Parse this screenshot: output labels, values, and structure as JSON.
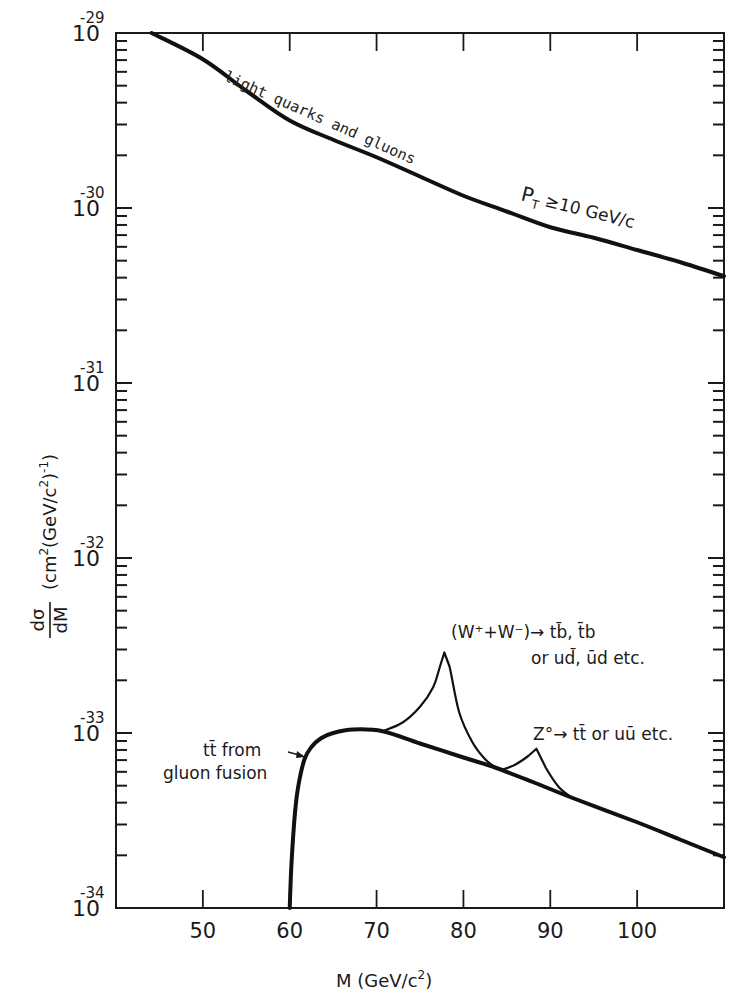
{
  "chart_data": {
    "type": "line",
    "title": "",
    "xlabel": "M (GeV/c²)",
    "ylabel": "dσ/dM (cm² (GeV/c²)⁻¹)",
    "xlim": [
      40,
      110
    ],
    "ylim": [
      1e-34,
      1e-29
    ],
    "yscale": "log",
    "grid": false,
    "legend": null,
    "x_ticks": [
      50,
      60,
      70,
      80,
      90,
      100
    ],
    "y_ticks": [
      {
        "base": "10",
        "exp": "-29",
        "value": 1e-29
      },
      {
        "base": "10",
        "exp": "-30",
        "value": 1e-30
      },
      {
        "base": "10",
        "exp": "-31",
        "value": 1e-31
      },
      {
        "base": "10",
        "exp": "-32",
        "value": 1e-32
      },
      {
        "base": "10",
        "exp": "-33",
        "value": 1e-33
      },
      {
        "base": "10",
        "exp": "-34",
        "value": 1e-34
      }
    ],
    "series": [
      {
        "name": "light quarks and gluons (P_T ≥ 10 GeV/c)",
        "style": "thick",
        "x": [
          44.1,
          50,
          55,
          60,
          65,
          70,
          75,
          80,
          85,
          90,
          95,
          100,
          105,
          110
        ],
        "log10_y": [
          -29.0,
          -29.15,
          -29.33,
          -29.5,
          -29.61,
          -29.71,
          -29.82,
          -29.93,
          -30.02,
          -30.11,
          -30.17,
          -30.24,
          -30.31,
          -30.39
        ]
      },
      {
        "name": "tt̄ from gluon fusion",
        "style": "thick",
        "x": [
          60.0,
          60.2,
          60.6,
          61.0,
          61.7,
          62.5,
          63.6,
          65.0,
          67.3,
          70.7,
          75,
          80,
          83.8,
          88,
          92.5,
          100,
          105,
          110
        ],
        "log10_y": [
          -34.0,
          -33.75,
          -33.46,
          -33.3,
          -33.15,
          -33.08,
          -33.03,
          -33.0,
          -32.98,
          -32.99,
          -33.06,
          -33.14,
          -33.2,
          -33.28,
          -33.37,
          -33.51,
          -33.61,
          -33.71
        ]
      },
      {
        "name": "(W⁺+W⁻) → tb̄, t̄b or ud̄, ūd etc.",
        "style": "thin",
        "x": [
          70.7,
          73,
          75,
          76.5,
          77.3,
          77.8,
          78.4,
          79.5,
          81,
          82.5,
          83.8
        ],
        "log10_y": [
          -32.99,
          -32.94,
          -32.85,
          -32.74,
          -32.62,
          -32.54,
          -32.62,
          -32.88,
          -33.05,
          -33.15,
          -33.2
        ]
      },
      {
        "name": "Z⁰ → tt̄ or uū etc.",
        "style": "thin",
        "x": [
          84.5,
          86,
          87.5,
          88.4,
          89.5,
          91,
          92.5
        ],
        "log10_y": [
          -33.21,
          -33.18,
          -33.13,
          -33.09,
          -33.2,
          -33.31,
          -33.37
        ]
      }
    ],
    "annotations": [
      {
        "id": "lq",
        "text": "light quarks and gluons"
      },
      {
        "id": "pt",
        "text_main": "P",
        "text_sub": "T",
        "text_rest": " ≥10 GeV/c"
      },
      {
        "id": "w_line1",
        "text": "(W⁺+W⁻)→ tb̄, t̄b"
      },
      {
        "id": "w_line2",
        "text": "or ud̄, ūd  etc."
      },
      {
        "id": "z",
        "text": "Z°→ tt̄ or uū  etc."
      },
      {
        "id": "tt_line1",
        "text": "tt̄ from"
      },
      {
        "id": "tt_line2",
        "text": "gluon fusion"
      }
    ]
  },
  "labels": {
    "xaxis_main": "M  (GeV/c",
    "xaxis_sup": "2",
    "xaxis_close": ")",
    "yaxis_num": "dσ",
    "yaxis_den": "dM",
    "yaxis_units_a": "(cm",
    "yaxis_units_sup1": "2",
    "yaxis_units_b": "(GeV/c",
    "yaxis_units_sup2": "2",
    "yaxis_units_c": ")",
    "yaxis_units_sup3": "-1",
    "yaxis_units_d": ")"
  }
}
